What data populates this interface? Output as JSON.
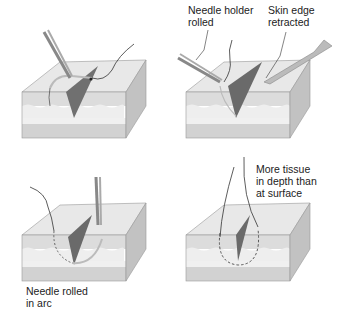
{
  "figure": {
    "panels": [
      {
        "id": "panel-1",
        "label": ""
      },
      {
        "id": "panel-2",
        "labels": [
          "Needle holder\nrolled",
          "Skin edge\nretracted"
        ]
      },
      {
        "id": "panel-3",
        "label": "Needle rolled\nin arc"
      },
      {
        "id": "panel-4",
        "label": "More tissue\nin depth than\nat surface"
      }
    ]
  },
  "colors": {
    "surface": "#e6e6e6",
    "dermis": "#d6d6d6",
    "fat": "#ececec",
    "base": "#cfcfcf",
    "side": "#bdbdbd",
    "incision": "#6e6e6e",
    "line": "#333333",
    "instrument": "#9a9a9a"
  }
}
